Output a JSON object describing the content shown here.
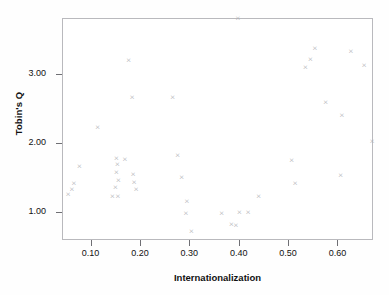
{
  "chart_data": {
    "type": "scatter",
    "title": "",
    "xlabel": "Internationalization",
    "ylabel": "Tobin's Q",
    "xlim": [
      0.042,
      0.672
    ],
    "ylim": [
      0.6,
      3.8
    ],
    "xticks": [
      "0.10",
      "0.20",
      "0.30",
      "0.40",
      "0.50",
      "0.60"
    ],
    "xtick_values": [
      0.1,
      0.2,
      0.3,
      0.4,
      0.5,
      0.6
    ],
    "yticks": [
      "1.00",
      "2.00",
      "3.00"
    ],
    "ytick_values": [
      1.0,
      2.0,
      3.0
    ],
    "grid": false,
    "legend": "none",
    "marker": "x",
    "marker_color": "#b0b0b4",
    "frame_color": "#b9b9bd",
    "points": [
      {
        "x": 0.052,
        "y": 1.27
      },
      {
        "x": 0.06,
        "y": 1.34
      },
      {
        "x": 0.064,
        "y": 1.43
      },
      {
        "x": 0.075,
        "y": 1.67
      },
      {
        "x": 0.112,
        "y": 2.23
      },
      {
        "x": 0.142,
        "y": 1.24
      },
      {
        "x": 0.15,
        "y": 1.79
      },
      {
        "x": 0.152,
        "y": 1.7
      },
      {
        "x": 0.15,
        "y": 1.59
      },
      {
        "x": 0.154,
        "y": 1.47
      },
      {
        "x": 0.148,
        "y": 1.37
      },
      {
        "x": 0.153,
        "y": 1.24
      },
      {
        "x": 0.167,
        "y": 1.77
      },
      {
        "x": 0.175,
        "y": 3.2
      },
      {
        "x": 0.182,
        "y": 2.67
      },
      {
        "x": 0.184,
        "y": 1.56
      },
      {
        "x": 0.186,
        "y": 1.44
      },
      {
        "x": 0.19,
        "y": 1.34
      },
      {
        "x": 0.264,
        "y": 2.67
      },
      {
        "x": 0.274,
        "y": 1.83
      },
      {
        "x": 0.282,
        "y": 1.51
      },
      {
        "x": 0.293,
        "y": 1.17
      },
      {
        "x": 0.291,
        "y": 0.99
      },
      {
        "x": 0.302,
        "y": 0.73
      },
      {
        "x": 0.363,
        "y": 1.0
      },
      {
        "x": 0.396,
        "y": 3.81
      },
      {
        "x": 0.383,
        "y": 0.84
      },
      {
        "x": 0.392,
        "y": 0.83
      },
      {
        "x": 0.399,
        "y": 1.01
      },
      {
        "x": 0.417,
        "y": 1.01
      },
      {
        "x": 0.438,
        "y": 1.24
      },
      {
        "x": 0.505,
        "y": 1.76
      },
      {
        "x": 0.512,
        "y": 1.43
      },
      {
        "x": 0.533,
        "y": 3.1
      },
      {
        "x": 0.543,
        "y": 3.21
      },
      {
        "x": 0.552,
        "y": 3.37
      },
      {
        "x": 0.574,
        "y": 2.59
      },
      {
        "x": 0.604,
        "y": 1.54
      },
      {
        "x": 0.607,
        "y": 2.41
      },
      {
        "x": 0.625,
        "y": 3.33
      },
      {
        "x": 0.652,
        "y": 3.13
      },
      {
        "x": 0.668,
        "y": 2.04
      }
    ]
  }
}
